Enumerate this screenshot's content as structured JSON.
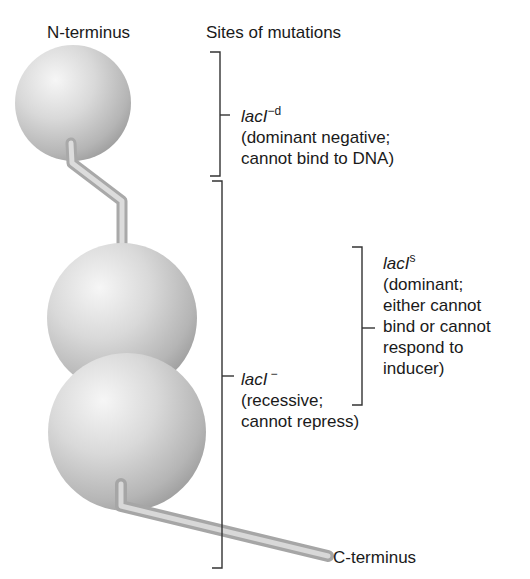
{
  "figure": {
    "headings": {
      "n_terminus": "N-terminus",
      "sites_of_mutations": "Sites of mutations",
      "c_terminus": "C-terminus"
    },
    "colors": {
      "background": "#ffffff",
      "text": "#1a1a1a",
      "bracket": "#333333",
      "sphere_light": "#f2f2f2",
      "sphere_mid": "#cfcfcf",
      "sphere_dark": "#9c9c9c"
    },
    "protein_domains": [
      {
        "name": "N-terminal DNA-binding domain",
        "cx": 73,
        "cy": 103,
        "r": 58
      },
      {
        "name": "core domain 1",
        "cx": 122,
        "cy": 318,
        "r": 75
      },
      {
        "name": "core domain 2",
        "cx": 127,
        "cy": 432,
        "r": 79
      }
    ],
    "mutations": [
      {
        "gene": "lacI",
        "superscript": "−d",
        "line1": "(dominant negative;",
        "line2": "cannot bind to DNA)"
      },
      {
        "gene": "lacI",
        "superscript": "s",
        "line1": "(dominant;",
        "line2": "either cannot",
        "line3": "bind or cannot",
        "line4": "respond to",
        "line5": "inducer)"
      },
      {
        "gene": "lacI",
        "superscript": "−",
        "line1": "(recessive;",
        "line2": "cannot repress)"
      }
    ]
  }
}
